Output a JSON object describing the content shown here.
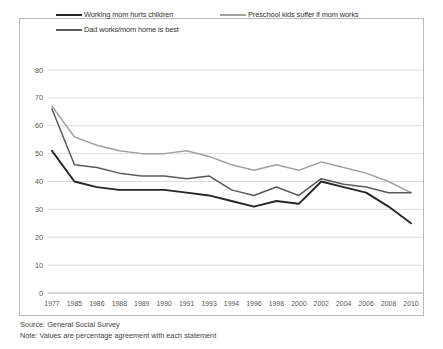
{
  "chart_data": {
    "type": "line",
    "title": "",
    "xlabel": "",
    "ylabel": "",
    "ylim": [
      0,
      80
    ],
    "ytick_step": 10,
    "grid": true,
    "legend_position": "top",
    "categories": [
      "1977",
      "1985",
      "1986",
      "1988",
      "1989",
      "1990",
      "1991",
      "1993",
      "1994",
      "1996",
      "1998",
      "2000",
      "2002",
      "2004",
      "2006",
      "2008",
      "2010"
    ],
    "yticks": [
      "0",
      "10",
      "20",
      "30",
      "40",
      "50",
      "60",
      "70",
      "80"
    ],
    "series": [
      {
        "name": "Working mom hurts children",
        "color": "#262626",
        "values": [
          51,
          40,
          38,
          37,
          37,
          37,
          36,
          35,
          33,
          31,
          33,
          32,
          40,
          38,
          36,
          31,
          25
        ]
      },
      {
        "name": "Preschool kids suffer if mom works",
        "color": "#a0a0a0",
        "values": [
          67,
          56,
          53,
          51,
          50,
          50,
          51,
          49,
          46,
          44,
          46,
          44,
          47,
          45,
          43,
          40,
          36
        ]
      },
      {
        "name": "Dad works/mom home is best",
        "color": "#5a5a5a",
        "values": [
          66,
          46,
          45,
          43,
          42,
          42,
          41,
          42,
          37,
          35,
          38,
          35,
          41,
          39,
          38,
          36,
          36
        ]
      }
    ]
  },
  "legend": {
    "items": [
      {
        "label": "Working mom hurts children"
      },
      {
        "label": "Preschool kids suffer if mom works"
      },
      {
        "label": "Dad works/mom home is best"
      }
    ]
  },
  "notes": {
    "source": "Source: General Social Survey",
    "note": "Note: Values are percentage agreement with each statement"
  }
}
